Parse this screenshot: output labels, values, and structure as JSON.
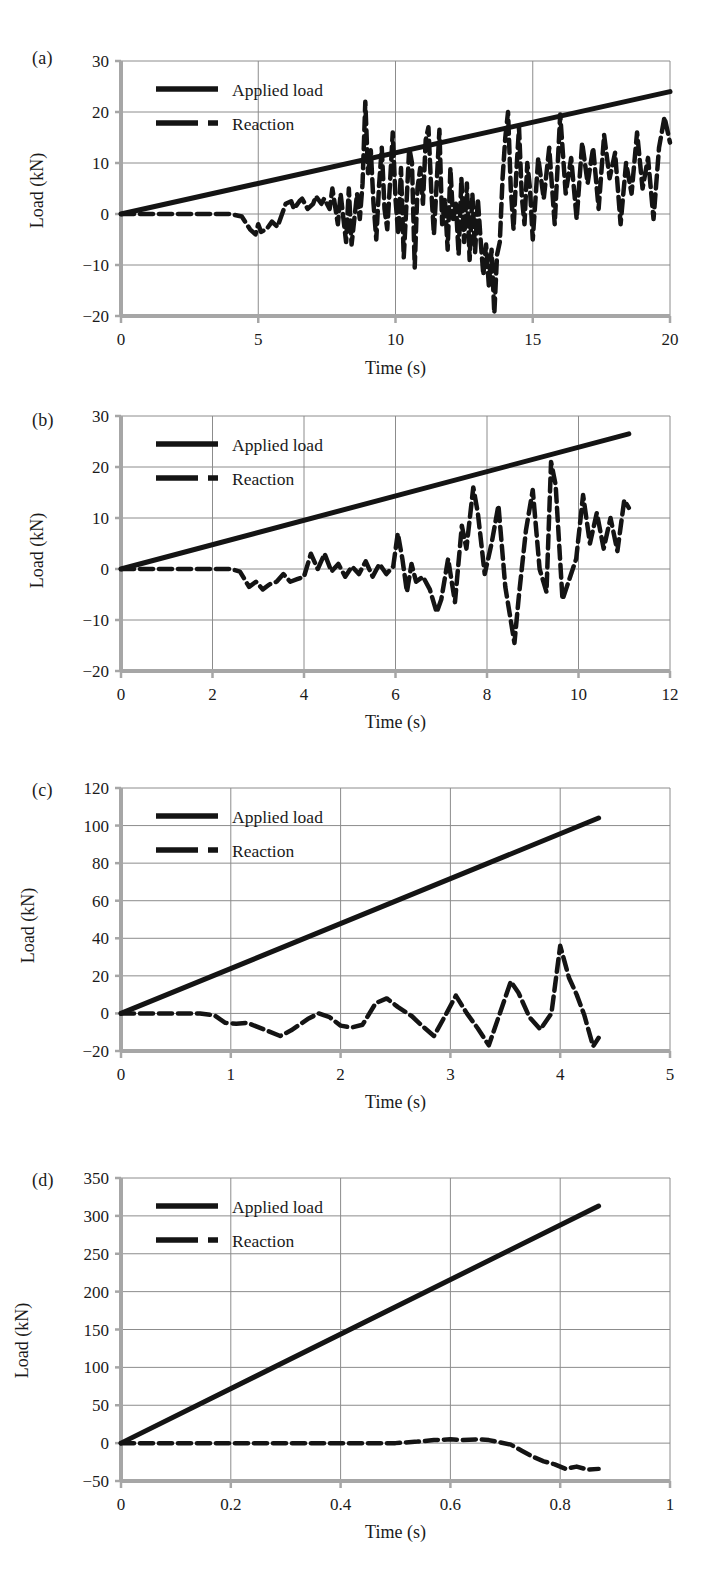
{
  "figure": {
    "panel_count": 4,
    "background": "#ffffff",
    "series_color": "#141414",
    "grid_color": "#8c8c8c",
    "axis_color": "#a6a6a6"
  },
  "chart_data": [
    {
      "type": "line",
      "panel": "(a)",
      "title": "",
      "xlabel": "Time (s)",
      "ylabel": "Load (kN)",
      "xlim": [
        0,
        20
      ],
      "ylim": [
        -20,
        30
      ],
      "xticks": [
        0,
        5,
        10,
        15,
        20
      ],
      "yticks": [
        -20,
        -10,
        0,
        10,
        20,
        30
      ],
      "xtick_labels": [
        "0",
        "5",
        "10",
        "15",
        "20"
      ],
      "ytick_labels": [
        "−20",
        "−10",
        "0",
        "10",
        "20",
        "30"
      ],
      "grid": true,
      "legend_position": "top-left",
      "series": [
        {
          "name": "Applied load",
          "style": "solid",
          "x": [
            0,
            20
          ],
          "values": [
            0,
            24
          ]
        },
        {
          "name": "Reaction",
          "style": "dashed",
          "x": [
            0.0,
            0.5,
            1.0,
            1.5,
            2.0,
            2.5,
            3.0,
            3.5,
            4.0,
            4.4,
            4.7,
            4.9,
            5.0,
            5.1,
            5.3,
            5.5,
            5.7,
            5.9,
            6.0,
            6.2,
            6.3,
            6.5,
            6.6,
            6.8,
            7.0,
            7.1,
            7.3,
            7.4,
            7.6,
            7.7,
            7.9,
            8.0,
            8.2,
            8.3,
            8.4,
            8.6,
            8.7,
            8.8,
            8.9,
            9.0,
            9.1,
            9.2,
            9.3,
            9.4,
            9.5,
            9.6,
            9.7,
            9.8,
            9.9,
            10.0,
            10.1,
            10.2,
            10.3,
            10.4,
            10.5,
            10.6,
            10.7,
            10.8,
            10.9,
            11.0,
            11.1,
            11.2,
            11.3,
            11.4,
            11.5,
            11.6,
            11.7,
            11.8,
            11.9,
            12.0,
            12.1,
            12.2,
            12.3,
            12.4,
            12.5,
            12.6,
            12.7,
            12.8,
            12.9,
            13.0,
            13.1,
            13.2,
            13.3,
            13.4,
            13.5,
            13.6,
            13.7,
            13.8,
            13.9,
            14.0,
            14.1,
            14.2,
            14.3,
            14.4,
            14.5,
            14.6,
            14.7,
            14.8,
            14.9,
            15.0,
            15.2,
            15.4,
            15.6,
            15.8,
            16.0,
            16.2,
            16.4,
            16.6,
            16.8,
            17.0,
            17.2,
            17.4,
            17.6,
            17.8,
            18.0,
            18.2,
            18.4,
            18.6,
            18.8,
            19.0,
            19.2,
            19.4,
            19.6,
            19.8,
            20.0
          ],
          "values": [
            0,
            0,
            0,
            0,
            0,
            0,
            0,
            0,
            0,
            -0.5,
            -3.0,
            -4.0,
            -2.0,
            -3.5,
            -3.0,
            -1.5,
            -2.5,
            0.5,
            2.0,
            2.5,
            1.0,
            2.5,
            3.0,
            1.0,
            2.0,
            3.5,
            2.0,
            3.0,
            1.0,
            5.0,
            -2.0,
            4.0,
            -5.5,
            5.0,
            -6.0,
            4.0,
            -1.0,
            6.0,
            22.0,
            8.0,
            12.5,
            2.0,
            -5.0,
            5.5,
            13.0,
            1.0,
            -3.0,
            6.0,
            16.0,
            3.0,
            -4.0,
            9.0,
            -8.5,
            2.0,
            13.0,
            10.0,
            -10.5,
            5.0,
            9.0,
            2.0,
            14.5,
            17.0,
            5.0,
            -4.0,
            6.0,
            16.5,
            -2.0,
            3.0,
            -7.0,
            9.0,
            -1.0,
            2.0,
            -8.0,
            7.0,
            -5.5,
            6.0,
            -9.0,
            4.0,
            -7.5,
            3.0,
            -5.0,
            -12.0,
            -6.0,
            -14.0,
            -7.0,
            -19.5,
            -8.0,
            -5.5,
            7.0,
            15.0,
            20.0,
            5.0,
            -3.0,
            8.0,
            17.0,
            3.5,
            -2.0,
            10.0,
            5.0,
            -5.0,
            11.0,
            3.0,
            13.0,
            -2.0,
            19.5,
            4.0,
            11.0,
            -1.0,
            14.0,
            6.0,
            13.0,
            1.0,
            15.5,
            7.0,
            12.0,
            -2.0,
            10.0,
            4.0,
            16.0,
            5.0,
            11.0,
            -1.0,
            13.0,
            19.0,
            14.0
          ]
        }
      ]
    },
    {
      "type": "line",
      "panel": "(b)",
      "title": "",
      "xlabel": "Time (s)",
      "ylabel": "Load (kN)",
      "xlim": [
        0,
        12
      ],
      "ylim": [
        -20,
        30
      ],
      "xticks": [
        0,
        2,
        4,
        6,
        8,
        10,
        12
      ],
      "yticks": [
        -20,
        -10,
        0,
        10,
        20,
        30
      ],
      "xtick_labels": [
        "0",
        "2",
        "4",
        "6",
        "8",
        "10",
        "12"
      ],
      "ytick_labels": [
        "−20",
        "−10",
        "0",
        "10",
        "20",
        "30"
      ],
      "grid": true,
      "legend_position": "top-left",
      "series": [
        {
          "name": "Applied load",
          "style": "solid",
          "x": [
            0,
            11.1
          ],
          "values": [
            0,
            26.5
          ]
        },
        {
          "name": "Reaction",
          "style": "dashed",
          "x": [
            0.0,
            0.4,
            0.8,
            1.2,
            1.6,
            2.0,
            2.4,
            2.6,
            2.8,
            2.95,
            3.1,
            3.25,
            3.4,
            3.55,
            3.7,
            3.85,
            4.0,
            4.15,
            4.3,
            4.45,
            4.6,
            4.75,
            4.9,
            5.05,
            5.2,
            5.35,
            5.5,
            5.65,
            5.8,
            5.95,
            6.05,
            6.15,
            6.25,
            6.35,
            6.45,
            6.6,
            6.75,
            6.9,
            7.0,
            7.15,
            7.3,
            7.45,
            7.55,
            7.7,
            7.8,
            7.95,
            8.1,
            8.25,
            8.4,
            8.5,
            8.6,
            8.7,
            8.85,
            9.0,
            9.15,
            9.3,
            9.4,
            9.5,
            9.65,
            9.8,
            9.95,
            10.1,
            10.25,
            10.4,
            10.55,
            10.7,
            10.85,
            11.0,
            11.1
          ],
          "values": [
            0,
            0,
            0,
            0,
            0,
            0,
            0,
            -0.5,
            -3.5,
            -2.5,
            -4.0,
            -3.0,
            -2.5,
            -1.0,
            -2.5,
            -2.0,
            -1.5,
            3.0,
            0.0,
            3.0,
            -0.5,
            1.0,
            -1.5,
            0.5,
            -1.0,
            1.5,
            -1.5,
            1.0,
            -1.0,
            0.5,
            7.0,
            2.0,
            -4.5,
            1.0,
            -2.5,
            -1.5,
            -4.0,
            -8.5,
            -6.0,
            2.0,
            -6.5,
            8.5,
            4.0,
            16.0,
            11.0,
            -1.0,
            5.0,
            12.5,
            -3.5,
            -9.0,
            -14.5,
            -5.0,
            7.5,
            15.5,
            0.0,
            -4.5,
            21.0,
            16.5,
            -6.0,
            -2.0,
            2.0,
            14.5,
            5.0,
            11.0,
            4.0,
            10.0,
            3.5,
            13.5,
            12.0
          ]
        }
      ]
    },
    {
      "type": "line",
      "panel": "(c)",
      "title": "",
      "xlabel": "Time (s)",
      "ylabel": "Load (kN)",
      "xlim": [
        0,
        5
      ],
      "ylim": [
        -20,
        120
      ],
      "xticks": [
        0,
        1,
        2,
        3,
        4,
        5
      ],
      "yticks": [
        -20,
        0,
        20,
        40,
        60,
        80,
        100,
        120
      ],
      "xtick_labels": [
        "0",
        "1",
        "2",
        "3",
        "4",
        "5"
      ],
      "ytick_labels": [
        "−20",
        "0",
        "20",
        "40",
        "60",
        "80",
        "100",
        "120"
      ],
      "grid": true,
      "legend_position": "top-left",
      "series": [
        {
          "name": "Applied load",
          "style": "solid",
          "x": [
            0,
            4.35
          ],
          "values": [
            0,
            104
          ]
        },
        {
          "name": "Reaction",
          "style": "dashed",
          "x": [
            0.0,
            0.15,
            0.3,
            0.45,
            0.6,
            0.72,
            0.85,
            0.95,
            1.05,
            1.15,
            1.3,
            1.45,
            1.55,
            1.7,
            1.8,
            1.9,
            2.0,
            2.1,
            2.2,
            2.32,
            2.42,
            2.52,
            2.65,
            2.75,
            2.85,
            2.95,
            3.05,
            3.15,
            3.25,
            3.35,
            3.45,
            3.55,
            3.62,
            3.72,
            3.82,
            3.92,
            4.0,
            4.08,
            4.15,
            4.22,
            4.3,
            4.35
          ],
          "values": [
            0,
            0,
            0,
            0,
            0,
            0,
            -1.0,
            -5.0,
            -5.5,
            -5.0,
            -8.5,
            -12.0,
            -9.0,
            -3.0,
            0.0,
            -2.0,
            -6.5,
            -7.5,
            -6.0,
            5.5,
            8.0,
            3.5,
            -1.5,
            -7.0,
            -12.0,
            -1.5,
            9.5,
            0.0,
            -8.0,
            -17.0,
            0.0,
            17.0,
            11.0,
            -2.0,
            -8.5,
            0.0,
            36.0,
            19.0,
            10.0,
            -1.0,
            -17.5,
            -13.0
          ]
        }
      ]
    },
    {
      "type": "line",
      "panel": "(d)",
      "title": "",
      "xlabel": "Time (s)",
      "ylabel": "Load (kN)",
      "xlim": [
        0,
        1
      ],
      "ylim": [
        -50,
        350
      ],
      "xticks": [
        0,
        0.2,
        0.4,
        0.6,
        0.8,
        1
      ],
      "yticks": [
        -50,
        0,
        50,
        100,
        150,
        200,
        250,
        300,
        350
      ],
      "xtick_labels": [
        "0",
        "0.2",
        "0.4",
        "0.6",
        "0.8",
        "1"
      ],
      "ytick_labels": [
        "−50",
        "0",
        "50",
        "100",
        "150",
        "200",
        "250",
        "300",
        "350"
      ],
      "grid": true,
      "legend_position": "top-left",
      "series": [
        {
          "name": "Applied load",
          "style": "solid",
          "x": [
            0,
            0.87
          ],
          "values": [
            0,
            313
          ]
        },
        {
          "name": "Reaction",
          "style": "dashed",
          "x": [
            0.0,
            0.05,
            0.1,
            0.15,
            0.2,
            0.25,
            0.3,
            0.35,
            0.4,
            0.45,
            0.5,
            0.54,
            0.57,
            0.6,
            0.62,
            0.65,
            0.67,
            0.69,
            0.71,
            0.73,
            0.75,
            0.77,
            0.79,
            0.81,
            0.83,
            0.85,
            0.87
          ],
          "values": [
            0,
            0,
            0,
            0,
            0,
            0,
            0,
            0,
            0,
            0,
            0,
            2.0,
            4.0,
            5.0,
            4.0,
            5.0,
            4.0,
            1.0,
            -2.0,
            -10.0,
            -18.0,
            -24.0,
            -28.0,
            -34.0,
            -31.0,
            -35.0,
            -34.0
          ]
        }
      ]
    }
  ],
  "legend": {
    "applied_load_label": "Applied load",
    "reaction_label": "Reaction"
  },
  "panels": [
    {
      "label": "(a)",
      "ylabel": "Load (kN)",
      "xlabel": "Time (s)"
    },
    {
      "label": "(b)",
      "ylabel": "Load (kN)",
      "xlabel": "Time (s)"
    },
    {
      "label": "(c)",
      "ylabel": "Load (kN)",
      "xlabel": "Time (s)"
    },
    {
      "label": "(d)",
      "ylabel": "Load (kN)",
      "xlabel": "Time (s)"
    }
  ]
}
